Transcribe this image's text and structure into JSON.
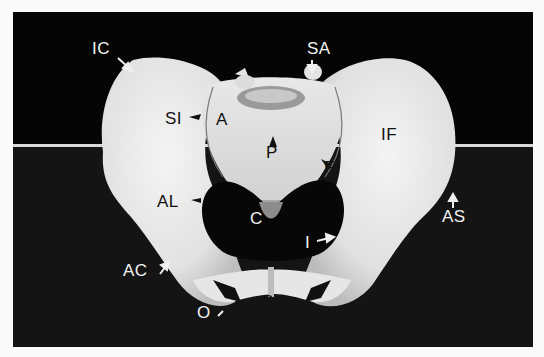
{
  "figure": {
    "colors": {
      "background": "#050505",
      "bone": "#e9e9e9",
      "page": "#fafafa",
      "table_edge": "#d8d8d8"
    },
    "labels": [
      {
        "id": "IC",
        "text": "IC",
        "x": 92,
        "y": 40,
        "color": "white"
      },
      {
        "id": "SA",
        "text": "SA",
        "x": 307,
        "y": 40,
        "color": "white"
      },
      {
        "id": "SI",
        "text": "SI",
        "x": 165,
        "y": 110,
        "color": "black"
      },
      {
        "id": "A",
        "text": "A",
        "x": 216,
        "y": 111,
        "color": "black"
      },
      {
        "id": "IF",
        "text": "IF",
        "x": 381,
        "y": 126,
        "color": "black"
      },
      {
        "id": "P",
        "text": "P",
        "x": 266,
        "y": 144,
        "color": "black"
      },
      {
        "id": "F",
        "text": "F",
        "x": 324,
        "y": 159,
        "color": "black"
      },
      {
        "id": "AL",
        "text": "AL",
        "x": 157,
        "y": 193,
        "color": "black"
      },
      {
        "id": "C",
        "text": "C",
        "x": 250,
        "y": 210,
        "color": "white"
      },
      {
        "id": "AS",
        "text": "AS",
        "x": 442,
        "y": 208,
        "color": "white"
      },
      {
        "id": "I",
        "text": "I",
        "x": 299,
        "y": 234,
        "color": "white"
      },
      {
        "id": "AC",
        "text": "AC",
        "x": 123,
        "y": 262,
        "color": "white"
      },
      {
        "id": "S",
        "text": "S",
        "x": 262,
        "y": 293,
        "color": "black"
      },
      {
        "id": "O",
        "text": "O",
        "x": 197,
        "y": 304,
        "color": "white"
      }
    ]
  }
}
